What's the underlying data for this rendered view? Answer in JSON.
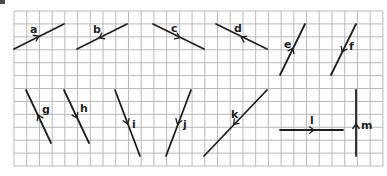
{
  "diagram": {
    "grid": {
      "x0": 14,
      "y0": 11,
      "cols": 29,
      "rows": 12,
      "cell_w": 12.72,
      "cell_h": 12.92,
      "line_color": "#b9b9b9"
    },
    "line_color": "#1f1f1f",
    "segments": [
      {
        "label": "a",
        "x1": 14,
        "y1": 49,
        "x2": 64,
        "y2": 24,
        "arrow_x": 37,
        "arrow_y": 37,
        "arrow_dir": "toward-end",
        "label_x": 30,
        "label_y": 33
      },
      {
        "label": "b",
        "x1": 77,
        "y1": 49,
        "x2": 127,
        "y2": 24,
        "arrow_x": 101,
        "arrow_y": 37,
        "arrow_dir": "toward-start",
        "label_x": 93,
        "label_y": 33
      },
      {
        "label": "c",
        "x1": 153,
        "y1": 24,
        "x2": 204,
        "y2": 49,
        "arrow_x": 178,
        "arrow_y": 37,
        "arrow_dir": "toward-end",
        "label_x": 171,
        "label_y": 32
      },
      {
        "label": "d",
        "x1": 216,
        "y1": 24,
        "x2": 267,
        "y2": 49,
        "arrow_x": 243,
        "arrow_y": 38,
        "arrow_dir": "toward-start",
        "label_x": 234,
        "label_y": 32
      },
      {
        "label": "e",
        "x1": 280,
        "y1": 75,
        "x2": 305,
        "y2": 24,
        "arrow_x": 292,
        "arrow_y": 50,
        "arrow_dir": "toward-end",
        "label_x": 284,
        "label_y": 48
      },
      {
        "label": "f",
        "x1": 356,
        "y1": 24,
        "x2": 331,
        "y2": 75,
        "arrow_x": 343,
        "arrow_y": 50,
        "arrow_dir": "toward-end",
        "label_x": 349,
        "label_y": 50
      },
      {
        "label": "g",
        "x1": 51,
        "y1": 143,
        "x2": 26,
        "y2": 90,
        "arrow_x": 39,
        "arrow_y": 117,
        "arrow_dir": "toward-end",
        "label_x": 42,
        "label_y": 113
      },
      {
        "label": "h",
        "x1": 64,
        "y1": 90,
        "x2": 89,
        "y2": 143,
        "arrow_x": 76,
        "arrow_y": 116,
        "arrow_dir": "toward-end",
        "label_x": 80,
        "label_y": 112
      },
      {
        "label": "i",
        "x1": 115,
        "y1": 90,
        "x2": 140,
        "y2": 156,
        "arrow_x": 127,
        "arrow_y": 122,
        "arrow_dir": "toward-end",
        "label_x": 132,
        "label_y": 128
      },
      {
        "label": "j",
        "x1": 191,
        "y1": 90,
        "x2": 166,
        "y2": 156,
        "arrow_x": 178,
        "arrow_y": 122,
        "arrow_dir": "toward-end",
        "label_x": 183,
        "label_y": 128
      },
      {
        "label": "k",
        "x1": 267,
        "y1": 90,
        "x2": 204,
        "y2": 156,
        "arrow_x": 235,
        "arrow_y": 123,
        "arrow_dir": "toward-end",
        "label_x": 231,
        "label_y": 118
      },
      {
        "label": "l",
        "x1": 280,
        "y1": 130,
        "x2": 343,
        "y2": 130,
        "arrow_x": 312,
        "arrow_y": 130,
        "arrow_dir": "toward-end",
        "label_x": 310,
        "label_y": 124
      },
      {
        "label": "m",
        "x1": 356,
        "y1": 156,
        "x2": 356,
        "y2": 90,
        "arrow_x": 356,
        "arrow_y": 126,
        "arrow_dir": "toward-end",
        "label_x": 361,
        "label_y": 129
      }
    ]
  }
}
